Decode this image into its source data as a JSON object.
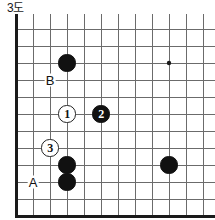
{
  "figure": {
    "title": "3도",
    "kind": "go-diagram",
    "colors": {
      "background": "#ffffff",
      "grid_line": "#6b6b6b",
      "border_line": "#1a1a1a",
      "black_stone": "#111111",
      "white_stone": "#ffffff",
      "stone_outline": "#222222",
      "text": "#111111"
    }
  },
  "board": {
    "origin_x": 16,
    "origin_y": 15,
    "cell": 17,
    "cols": 12,
    "rows": 11,
    "edges": {
      "left_thick": true,
      "bottom_thick": true,
      "top_open": true,
      "right_open": true
    },
    "star_points": [
      {
        "name": "hoshi",
        "col": 9,
        "row": 2
      }
    ]
  },
  "stones": [
    {
      "id": "black-top",
      "color": "black",
      "col": 3,
      "row": 2,
      "label": ""
    },
    {
      "id": "white-move-1",
      "color": "white",
      "col": 3,
      "row": 5,
      "label": "1"
    },
    {
      "id": "black-move-2",
      "color": "black",
      "col": 5,
      "row": 5,
      "label": "2"
    },
    {
      "id": "white-move-3",
      "color": "white",
      "col": 2,
      "row": 7,
      "label": "3"
    },
    {
      "id": "black-lower-upper",
      "color": "black",
      "col": 3,
      "row": 8,
      "label": ""
    },
    {
      "id": "black-lower-lower",
      "color": "black",
      "col": 3,
      "row": 9,
      "label": ""
    },
    {
      "id": "black-right",
      "color": "black",
      "col": 9,
      "row": 8,
      "label": ""
    }
  ],
  "markers": [
    {
      "id": "marker-b",
      "label": "B",
      "col": 2,
      "row": 3
    },
    {
      "id": "marker-a",
      "label": "A",
      "col": 1,
      "row": 9
    }
  ]
}
